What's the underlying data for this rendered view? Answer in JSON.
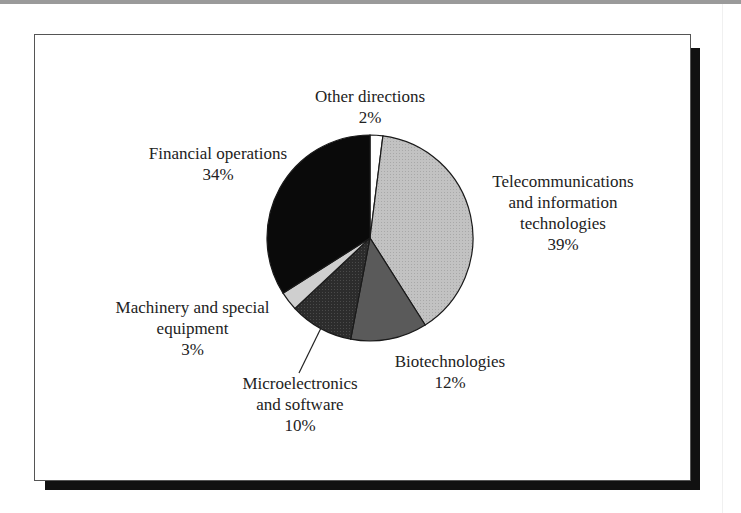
{
  "chart_data": {
    "type": "pie",
    "title": "",
    "start_angle_deg": 0,
    "direction": "clockwise",
    "slices": [
      {
        "label": "Other directions",
        "value": 2,
        "value_label": "2%",
        "color": "#ffffff"
      },
      {
        "label": "Telecommunications and information technologies",
        "value": 39,
        "value_label": "39%",
        "color": "#bdbdbd"
      },
      {
        "label": "Biotechnologies",
        "value": 12,
        "value_label": "12%",
        "color": "#5a5a5a"
      },
      {
        "label": "Microelectronics and software",
        "value": 10,
        "value_label": "10%",
        "color": "#2e2e2e"
      },
      {
        "label": "Machinery and special equipment",
        "value": 3,
        "value_label": "3%",
        "color": "#cfcfcf"
      },
      {
        "label": "Financial operations",
        "value": 34,
        "value_label": "34%",
        "color": "#0a0a0a"
      }
    ],
    "legend": "none (direct labels)",
    "leader_lines": [
      "Microelectronics and software"
    ]
  },
  "labels": {
    "other": {
      "line1": "Other directions",
      "pct": "2%"
    },
    "telecom": {
      "line1": "Telecommunications",
      "line2": "and information",
      "line3": "technologies",
      "pct": "39%"
    },
    "biotech": {
      "line1": "Biotechnologies",
      "pct": "12%"
    },
    "micro": {
      "line1": "Microelectronics",
      "line2": "and software",
      "pct": "10%"
    },
    "machinery": {
      "line1": "Machinery and special",
      "line2": "equipment",
      "pct": "3%"
    },
    "financial": {
      "line1": "Financial operations",
      "pct": "34%"
    }
  }
}
